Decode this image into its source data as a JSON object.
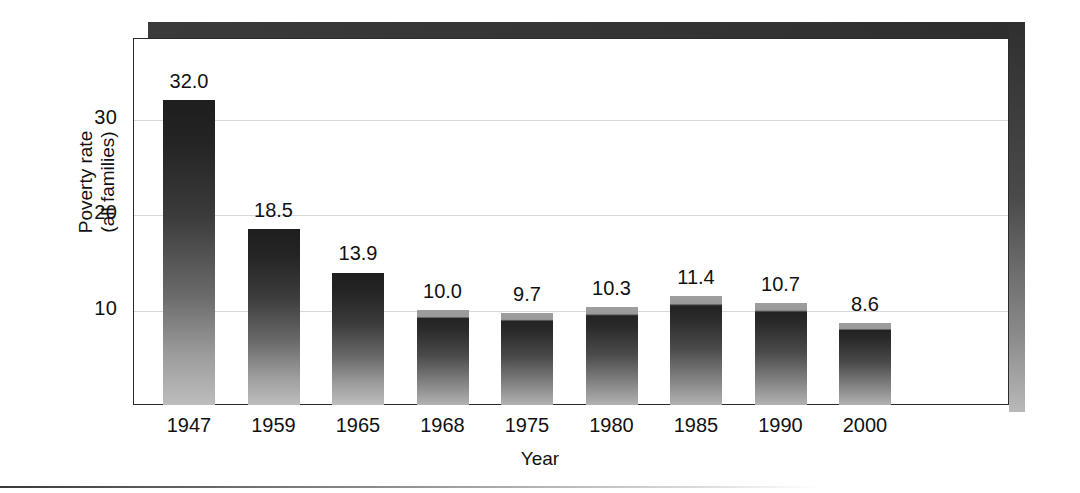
{
  "chart_data": {
    "type": "bar",
    "title": "",
    "subtitle": "",
    "xlabel": "Year",
    "ylabel": "Poverty rate (all families)",
    "ylabel_line1": "Poverty rate",
    "ylabel_line2": "(all families)",
    "categories": [
      "1947",
      "1959",
      "1965",
      "1968",
      "1975",
      "1980",
      "1985",
      "1990",
      "2000"
    ],
    "values": [
      32.0,
      18.5,
      13.9,
      10.0,
      9.7,
      10.3,
      11.4,
      10.7,
      8.6
    ],
    "value_labels": [
      "32.0",
      "18.5",
      "13.9",
      "10.0",
      "9.7",
      "10.3",
      "11.4",
      "10.7",
      "8.6"
    ],
    "ytick_labels": [
      "30",
      "20",
      "10"
    ],
    "ytick_values": [
      30,
      20,
      10
    ],
    "ylim": [
      0,
      38.5
    ],
    "xlim_categories": 9,
    "grid": true,
    "grid_axis": "y",
    "legend": null,
    "legend_position": "none",
    "series": [
      {
        "name": "Poverty rate (all families)",
        "values": [
          32.0,
          18.5,
          13.9,
          10.0,
          9.7,
          10.3,
          11.4,
          10.7,
          8.6
        ]
      }
    ],
    "colors": {
      "bar_top": "#1e1e1e",
      "bar_bottom": "#bdbdbd",
      "frame": "#2b2b2b",
      "gridline": "#d8d8d8",
      "shadow": "#333333",
      "text": "#111111",
      "background": "#ffffff"
    }
  }
}
